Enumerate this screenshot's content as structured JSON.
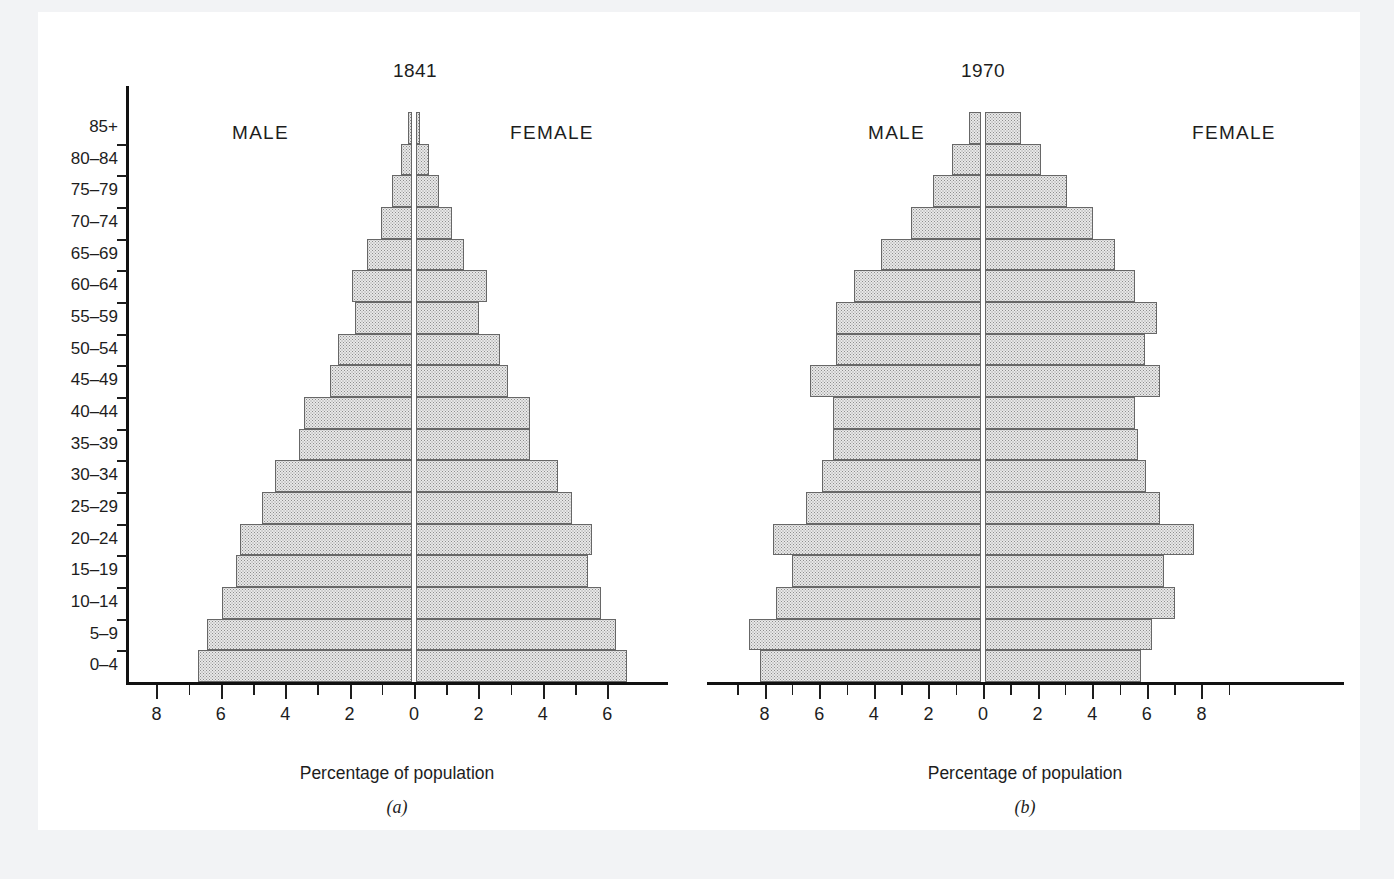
{
  "figure": {
    "axis_title": "Percentage of population",
    "age_groups": [
      "85+",
      "80–84",
      "75–79",
      "70–74",
      "65–69",
      "60–64",
      "55–59",
      "50–54",
      "45–49",
      "40–44",
      "35–39",
      "30–34",
      "25–29",
      "20–24",
      "15–19",
      "10–14",
      "5–9",
      "0–4"
    ],
    "male_label": "MALE",
    "female_label": "FEMALE"
  },
  "panels": [
    {
      "id": "panel-a",
      "caption": "(a)",
      "title": "1841",
      "xticks": [
        "8",
        "6",
        "4",
        "2",
        "0",
        "2",
        "4",
        "6"
      ]
    },
    {
      "id": "panel-b",
      "caption": "(b)",
      "title": "1970",
      "xticks": [
        "8",
        "6",
        "4",
        "2",
        "0",
        "2",
        "4",
        "6",
        "8"
      ]
    }
  ],
  "colors": {
    "bar_fill": "#e8e8e8",
    "bar_stipple": "#8d8d8d",
    "bar_border": "#676767",
    "axis": "#111111",
    "text": "#1d1d1d",
    "page": "#ffffff",
    "backdrop": "#f2f3f5"
  },
  "chart_data": [
    {
      "type": "bar",
      "subtype": "population-pyramid",
      "title": "1841",
      "panel": "(a)",
      "xlabel": "Percentage of population",
      "ylabel": "",
      "xlim": [
        -8.5,
        7.0
      ],
      "xtick_values": [
        -8,
        -6,
        -4,
        -2,
        0,
        2,
        4,
        6
      ],
      "xtick_labels": [
        "8",
        "6",
        "4",
        "2",
        "0",
        "2",
        "4",
        "6"
      ],
      "xtick_minor_step": 1,
      "grid": false,
      "legend": "none",
      "categories": [
        "85+",
        "80–84",
        "75–79",
        "70–74",
        "65–69",
        "60–64",
        "55–59",
        "50–54",
        "45–49",
        "40–44",
        "35–39",
        "30–34",
        "25–29",
        "20–24",
        "15–19",
        "10–14",
        "5–9",
        "0–4"
      ],
      "series": [
        {
          "name": "MALE",
          "direction": "left",
          "values": [
            0.12,
            0.35,
            0.6,
            0.95,
            1.4,
            1.85,
            1.75,
            2.3,
            2.55,
            3.35,
            3.5,
            4.25,
            4.65,
            5.35,
            5.45,
            5.9,
            6.35,
            6.65
          ]
        },
        {
          "name": "FEMALE",
          "direction": "right",
          "values": [
            0.12,
            0.4,
            0.7,
            1.1,
            1.5,
            2.2,
            1.95,
            2.6,
            2.85,
            3.55,
            3.55,
            4.4,
            4.85,
            5.45,
            5.35,
            5.75,
            6.2,
            6.55
          ]
        }
      ]
    },
    {
      "type": "bar",
      "subtype": "population-pyramid",
      "title": "1970",
      "panel": "(b)",
      "xlabel": "Percentage of population",
      "ylabel": "",
      "xlim": [
        -9.2,
        9.2
      ],
      "xtick_values": [
        -8,
        -6,
        -4,
        -2,
        0,
        2,
        4,
        6,
        8
      ],
      "xtick_labels": [
        "8",
        "6",
        "4",
        "2",
        "0",
        "2",
        "4",
        "6",
        "8"
      ],
      "xtick_minor_step": 1,
      "grid": false,
      "legend": "none",
      "categories": [
        "85+",
        "80–84",
        "75–79",
        "70–74",
        "65–69",
        "60–64",
        "55–59",
        "50–54",
        "45–49",
        "40–44",
        "35–39",
        "30–34",
        "25–29",
        "20–24",
        "15–19",
        "10–14",
        "5–9",
        "0–4"
      ],
      "series": [
        {
          "name": "MALE",
          "direction": "left",
          "values": [
            0.45,
            1.05,
            1.75,
            2.55,
            3.65,
            4.65,
            5.3,
            5.3,
            6.25,
            5.4,
            5.4,
            5.8,
            6.4,
            7.6,
            6.9,
            7.5,
            8.5,
            8.1
          ]
        },
        {
          "name": "FEMALE",
          "direction": "right",
          "values": [
            1.3,
            2.05,
            3.0,
            3.95,
            4.75,
            5.5,
            6.3,
            5.85,
            6.4,
            5.5,
            5.6,
            5.9,
            6.4,
            7.65,
            6.55,
            6.95,
            6.1,
            5.7
          ]
        }
      ]
    }
  ]
}
